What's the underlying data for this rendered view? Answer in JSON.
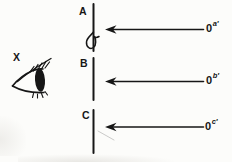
{
  "theme": {
    "ink_color": "#161616",
    "bg_color": "#fcfcfa",
    "smudge_color": "#d8d6d1"
  },
  "diagram": {
    "observer_label": "X",
    "slits": [
      {
        "label": "A"
      },
      {
        "label": "B"
      },
      {
        "label": "C"
      }
    ],
    "arrows": [
      {
        "base": "0",
        "sup": "a′"
      },
      {
        "base": "0",
        "sup": "b′"
      },
      {
        "base": "0",
        "sup": "c′"
      }
    ]
  }
}
